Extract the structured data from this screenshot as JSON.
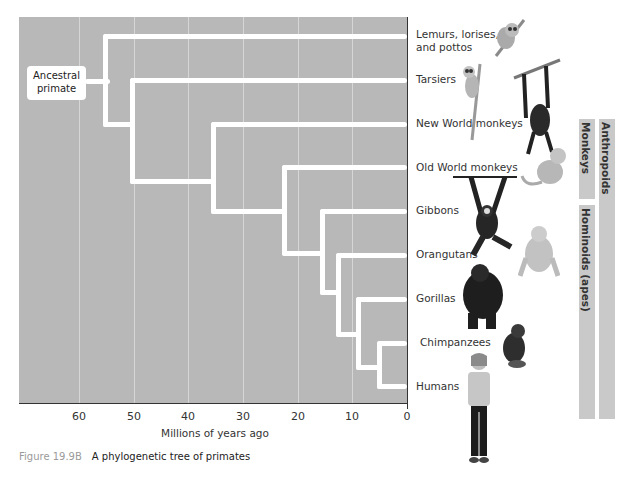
{
  "diagram": {
    "type": "phylogenetic_tree",
    "root_label": "Ancestral primate",
    "taxa": [
      {
        "label": "Lemurs, lorises,\nand pottos",
        "line1": "Lemurs, lorises,",
        "line2": "and pottos"
      },
      {
        "label": "Tarsiers"
      },
      {
        "label": "New World monkeys"
      },
      {
        "label": "Old World monkeys"
      },
      {
        "label": "Gibbons"
      },
      {
        "label": "Orangutans"
      },
      {
        "label": "Gorillas"
      },
      {
        "label": "Chimpanzees"
      },
      {
        "label": "Humans"
      }
    ],
    "divergences_mya": [
      {
        "split": "Lemurs, lorises, and pottos | rest",
        "mya": 55
      },
      {
        "split": "Tarsiers | Anthropoids",
        "mya": 50
      },
      {
        "split": "New World monkeys | rest",
        "mya": 35
      },
      {
        "split": "Old World monkeys | Hominoids",
        "mya": 22
      },
      {
        "split": "Gibbons | great apes",
        "mya": 15
      },
      {
        "split": "Orangutans | rest",
        "mya": 12
      },
      {
        "split": "Gorillas | Chimpanzees+Humans",
        "mya": 9
      },
      {
        "split": "Chimpanzees | Humans",
        "mya": 5
      }
    ],
    "groups": [
      {
        "label": "Monkeys",
        "members": [
          "New World monkeys",
          "Old World monkeys"
        ]
      },
      {
        "label": "Hominoids (apes)",
        "members": [
          "Gibbons",
          "Orangutans",
          "Gorillas",
          "Chimpanzees",
          "Humans"
        ]
      },
      {
        "label": "Anthropoids",
        "members": [
          "New World monkeys",
          "Old World monkeys",
          "Gibbons",
          "Orangutans",
          "Gorillas",
          "Chimpanzees",
          "Humans"
        ]
      }
    ]
  },
  "axis": {
    "label": "Millions of years ago",
    "ticks": [
      "60",
      "50",
      "40",
      "30",
      "20",
      "10",
      "0"
    ]
  },
  "caption": {
    "figure_number": "Figure 19.9B",
    "text": "A phylogenetic tree of primates"
  },
  "colors": {
    "plot_background": "#b8b8b8",
    "branches": "#ffffff",
    "group_bars": "#c9c9c9",
    "caption_number": "#9a9a9a"
  }
}
